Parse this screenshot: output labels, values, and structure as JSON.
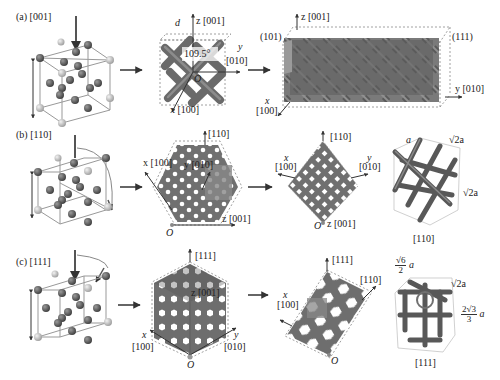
{
  "figure": {
    "rows": [
      {
        "id": "a",
        "panel_label": "(a)",
        "direction": "[001]",
        "unit_cell_axes": {
          "z": "z [001]",
          "y": "y",
          "y_dir": "[010]",
          "x": "x [100]",
          "angle": "109.5°",
          "d": "d",
          "r": "r",
          "origin": "O"
        },
        "bulk_labels": {
          "z": "z [001]",
          "plane_left": "(101)",
          "plane_right": "(111)",
          "y": "y [010]",
          "x": "x",
          "x_dir": "[100]"
        }
      },
      {
        "id": "b",
        "panel_label": "(b)",
        "direction": "[110]",
        "projection_labels": {
          "top": "[110]",
          "x": "x [100]",
          "y": "y [010]",
          "z": "z [001]",
          "origin": "O"
        },
        "slab_labels": {
          "top": "[110]",
          "x": "x",
          "x_dir": "[100]",
          "y": "y",
          "y_dir": "[010]",
          "z": "z [001]",
          "origin": "O"
        },
        "cell_labels": {
          "a": "a",
          "top_right": "√2a",
          "right": "√2a",
          "caption": "[110]"
        }
      },
      {
        "id": "c",
        "panel_label": "(c)",
        "direction": "[111]",
        "projection_labels": {
          "top": "[111]",
          "z": "z [001]",
          "x": "x",
          "x_dir": "[100]",
          "y": "y",
          "y_dir": "[010]",
          "origin": "O"
        },
        "slab_labels": {
          "top": "[111]",
          "right": "[110]",
          "x": "x",
          "x_dir": "[100]",
          "origin": "O"
        },
        "cell_labels": {
          "top_num": "√6",
          "top_den": "2",
          "top_suffix": "a",
          "top_right": "√2a",
          "right_num": "2√3",
          "right_den": "3",
          "right_suffix": "a",
          "caption": "[111]"
        }
      }
    ],
    "colors": {
      "strut": "#6e6e6e",
      "strut_dark": "#4a4a4a",
      "atom_dark": "#555555",
      "atom_light": "#c8c8c8",
      "cell_line": "#888888",
      "arrow": "#333333",
      "highlight": "#8a8a8a"
    }
  }
}
